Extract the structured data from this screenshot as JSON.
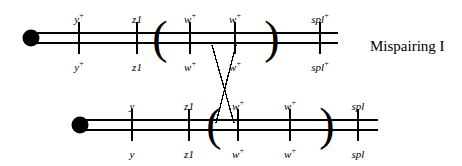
{
  "figure": {
    "caption": "Mispairing I",
    "caption_x": 370,
    "caption_y": 38,
    "width": 462,
    "height": 166,
    "background": "#ffffff",
    "ink_color": "#000000"
  },
  "chromosomes": [
    {
      "id": "upper",
      "name": "upper-homolog",
      "centromere": {
        "cx": 31,
        "cy": 38,
        "r": 8.5
      },
      "chromatids": [
        {
          "x1": 31,
          "x2": 338,
          "y": 33
        },
        {
          "x1": 31,
          "x2": 338,
          "y": 43
        }
      ],
      "tick_top_y": 22,
      "tick_bottom_y": 54,
      "label_top_y": 14,
      "label_bottom_y": 62,
      "loci": [
        {
          "name": "y-plus-upper",
          "x": 79,
          "gene": "y",
          "sup": "+",
          "italic_suffix": ""
        },
        {
          "name": "z1-upper",
          "x": 137,
          "gene": "z",
          "sup": "",
          "italic_suffix": "1"
        },
        {
          "name": "w-plus-upper-1",
          "x": 190,
          "gene": "w",
          "sup": "+",
          "italic_suffix": ""
        },
        {
          "name": "w-plus-upper-2",
          "x": 235,
          "gene": "w",
          "sup": "+",
          "italic_suffix": ""
        },
        {
          "name": "spl-plus-upper",
          "x": 320,
          "gene": "spl",
          "sup": "+",
          "italic_suffix": ""
        }
      ],
      "brackets": [
        {
          "name": "duplication-open-paren-upper",
          "glyph": "(",
          "x": 160,
          "y": 38,
          "size": 46
        },
        {
          "name": "duplication-close-paren-upper",
          "glyph": ")",
          "x": 272,
          "y": 38,
          "size": 46
        }
      ]
    },
    {
      "id": "lower",
      "name": "lower-homolog",
      "centromere": {
        "cx": 80,
        "cy": 125,
        "r": 8.5
      },
      "chromatids": [
        {
          "x1": 80,
          "x2": 378,
          "y": 120
        },
        {
          "x1": 80,
          "x2": 378,
          "y": 130
        }
      ],
      "tick_top_y": 109,
      "tick_bottom_y": 141,
      "label_top_y": 101,
      "label_bottom_y": 149,
      "loci": [
        {
          "name": "y-lower",
          "x": 132,
          "gene": "y",
          "sup": "",
          "italic_suffix": ""
        },
        {
          "name": "z1-lower",
          "x": 189,
          "gene": "z",
          "sup": "",
          "italic_suffix": "1"
        },
        {
          "name": "w-plus-lower-1",
          "x": 238,
          "gene": "w",
          "sup": "+",
          "italic_suffix": ""
        },
        {
          "name": "w-plus-lower-2",
          "x": 290,
          "gene": "w",
          "sup": "+",
          "italic_suffix": ""
        },
        {
          "name": "spl-lower",
          "x": 358,
          "gene": "spl",
          "sup": "",
          "italic_suffix": ""
        }
      ],
      "brackets": [
        {
          "name": "duplication-open-paren-lower",
          "glyph": "(",
          "x": 214,
          "y": 125,
          "size": 46
        },
        {
          "name": "duplication-close-paren-lower",
          "glyph": ")",
          "x": 327,
          "y": 125,
          "size": 46
        }
      ]
    }
  ],
  "mispairing_lines": [
    {
      "name": "mispair-strand-left",
      "x1": 212,
      "y1": 45,
      "x2": 234,
      "y2": 123
    },
    {
      "name": "mispair-strand-right",
      "x1": 236,
      "y1": 45,
      "x2": 216,
      "y2": 123
    }
  ]
}
